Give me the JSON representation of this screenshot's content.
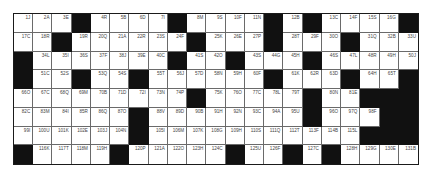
{
  "puzzle": {
    "type": "crossword-grid",
    "columns": 21,
    "rows": 8,
    "colors": {
      "block": "#111111",
      "cell": "#ffffff",
      "gridline": "#6a6a6a",
      "label": "#444444"
    },
    "grid": [
      [
        "1J",
        "2A",
        "3E",
        null,
        "4R",
        "5B",
        "6D",
        "7I",
        null,
        "8M",
        "9S",
        "10F",
        "11N",
        null,
        "12B",
        null,
        "13C",
        "14F",
        "15S",
        "16G",
        null
      ],
      [
        "17C",
        "18R",
        null,
        "19R",
        "20Q",
        "21A",
        "22R",
        "23S",
        "24F",
        null,
        "25K",
        "26E",
        "27P",
        null,
        "28T",
        "29F",
        "30O",
        null,
        "31Q",
        "32B",
        "33U"
      ],
      [
        null,
        "34L",
        "35I",
        "36S",
        "37F",
        "38J",
        "39E",
        "40C",
        null,
        "41S",
        "42O",
        null,
        "43S",
        "44G",
        "45H",
        null,
        "46S",
        "47L",
        "48R",
        "49H",
        "50J"
      ],
      [
        null,
        "51C",
        "52S",
        null,
        "53Q",
        "54S",
        null,
        "55T",
        "56J",
        "57D",
        "58N",
        "59H",
        "60F",
        null,
        "61K",
        "62R",
        "63D",
        null,
        "64H",
        "65T",
        null
      ],
      [
        "66O",
        "67C",
        "68Q",
        "69M",
        "70B",
        "71D",
        "72I",
        "73N",
        "74P",
        null,
        "75K",
        "76O",
        "77C",
        "78L",
        "79T",
        null,
        "80N",
        "81E",
        null,
        null,
        null
      ],
      [
        "82C",
        "83M",
        "84I",
        "85R",
        "86Q",
        "87O",
        null,
        "88V",
        "89D",
        "90B",
        "91H",
        "92N",
        "93C",
        "94A",
        "95U",
        null,
        "96O",
        "97Q",
        "98F",
        null,
        null
      ],
      [
        "99I",
        "100U",
        "101K",
        "102E",
        "103J",
        "104N",
        null,
        "105I",
        "106M",
        "107K",
        "108G",
        "109H",
        "110S",
        "111Q",
        "112T",
        "113F",
        "114B",
        "115L",
        null,
        null,
        null
      ],
      [
        null,
        "116K",
        "117T",
        "118M",
        "119H",
        null,
        "120P",
        "121A",
        "122O",
        "123H",
        "124C",
        null,
        "125U",
        "126F",
        null,
        "127C",
        null,
        "128H",
        "129G",
        "130E",
        "131B"
      ]
    ]
  }
}
